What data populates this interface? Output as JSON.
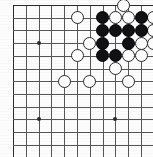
{
  "app": {
    "title": "Go board position diagram",
    "type": "goban-diagram"
  },
  "board": {
    "name": "go-board",
    "visible_columns": 11,
    "visible_rows": 12,
    "origin_x": 13,
    "origin_y": 5,
    "cell_w": 12.8,
    "cell_h": 12.7,
    "line_color": "#555557",
    "edge_color": "#2b2b2d",
    "background_color": "#fdfdfd",
    "black_color": "#111113",
    "white_color": "#fcfcfc",
    "stone_diameter": 13,
    "hoshi_color": "#2a2a2c",
    "hoshi_points": [
      {
        "col": 2,
        "row": 3,
        "label": "star-point-left"
      },
      {
        "col": 2,
        "row": 9,
        "label": "star-point-lower-left"
      },
      {
        "col": 8,
        "row": 9,
        "label": "star-point-lower-right"
      }
    ],
    "stones": [
      {
        "col": 8.6,
        "row": 0,
        "color": "white",
        "label": "white-top-edge"
      },
      {
        "col": 5,
        "row": 1,
        "color": "white",
        "label": "white-b5-left"
      },
      {
        "col": 7,
        "row": 1,
        "color": "black",
        "label": "black-c7"
      },
      {
        "col": 8,
        "row": 1,
        "color": "white",
        "label": "white-c8"
      },
      {
        "col": 9,
        "row": 1,
        "color": "white",
        "label": "white-c9"
      },
      {
        "col": 10,
        "row": 1,
        "color": "black",
        "label": "black-c10"
      },
      {
        "col": 11,
        "row": 1,
        "color": "white",
        "label": "white-c11"
      },
      {
        "col": 7,
        "row": 2,
        "color": "black",
        "label": "black-d7"
      },
      {
        "col": 8,
        "row": 2,
        "color": "black",
        "label": "black-d8"
      },
      {
        "col": 9,
        "row": 2,
        "color": "black",
        "label": "black-d9"
      },
      {
        "col": 10,
        "row": 2,
        "color": "black",
        "label": "black-d10"
      },
      {
        "col": 11,
        "row": 2,
        "color": "white",
        "label": "white-d11"
      },
      {
        "col": 6,
        "row": 3,
        "color": "white",
        "label": "white-e6"
      },
      {
        "col": 7,
        "row": 3,
        "color": "black",
        "label": "black-e7"
      },
      {
        "col": 9,
        "row": 3,
        "color": "black",
        "label": "black-e9"
      },
      {
        "col": 10,
        "row": 3,
        "color": "white",
        "label": "white-e10"
      },
      {
        "col": 11,
        "row": 3,
        "color": "white",
        "label": "white-e11"
      },
      {
        "col": 5,
        "row": 4,
        "color": "white",
        "label": "white-f5"
      },
      {
        "col": 7,
        "row": 4,
        "color": "black",
        "label": "black-f7"
      },
      {
        "col": 8,
        "row": 4,
        "color": "black",
        "label": "black-f8"
      },
      {
        "col": 9,
        "row": 4,
        "color": "white",
        "label": "white-f9"
      },
      {
        "col": 10,
        "row": 4,
        "color": "white",
        "label": "white-f10"
      },
      {
        "col": 8,
        "row": 5,
        "color": "white",
        "label": "white-g8"
      },
      {
        "col": 4,
        "row": 6,
        "color": "white",
        "label": "white-h4"
      },
      {
        "col": 6,
        "row": 6,
        "color": "white",
        "label": "white-h6"
      },
      {
        "col": 9,
        "row": 6,
        "color": "white",
        "label": "white-h9"
      }
    ]
  },
  "counts": {
    "black_stones": 12,
    "white_stones": 15
  }
}
